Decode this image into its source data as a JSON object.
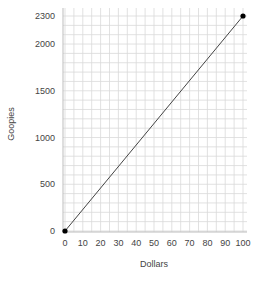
{
  "chart_data": {
    "type": "line",
    "title": "",
    "xlabel": "Dollars",
    "ylabel": "Goopies",
    "xlim": [
      0,
      100
    ],
    "ylim": [
      0,
      2300
    ],
    "x_ticks": [
      0,
      10,
      20,
      30,
      40,
      50,
      60,
      70,
      80,
      90,
      100
    ],
    "y_ticks": [
      0,
      500,
      1000,
      1500,
      2000,
      2300
    ],
    "grid": true,
    "legend": null,
    "series": [
      {
        "name": "Goopies vs Dollars",
        "x": [
          0,
          100
        ],
        "y": [
          0,
          2300
        ],
        "markers": "endpoints"
      }
    ]
  },
  "colors": {
    "line": "#444444",
    "marker": "#000000",
    "grid": "#d9d9d9",
    "axis": "#bdbdbd"
  }
}
